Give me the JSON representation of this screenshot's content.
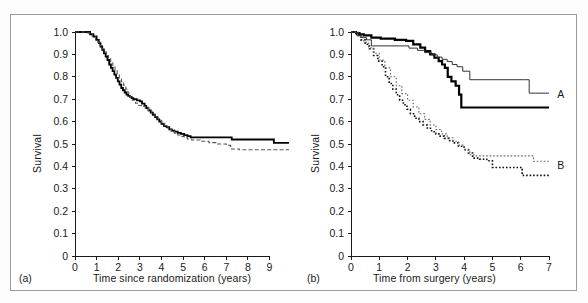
{
  "figure": {
    "background": "#ffffff",
    "frame_color": "#9a9a9a",
    "axis_color": "#1a1a1a"
  },
  "panels": [
    {
      "letter": "(a)",
      "ylabel": "Survival",
      "xlabel": "Time since randomization (years)",
      "curve_labels": []
    },
    {
      "letter": "(b)",
      "ylabel": "Survival",
      "xlabel": "Time from surgery (years)",
      "curve_labels": [
        {
          "text": "A",
          "x": 7.15,
          "y": 0.72
        },
        {
          "text": "B",
          "x": 7.15,
          "y": 0.4
        }
      ]
    }
  ],
  "chart_data": [
    {
      "id": "panel-a",
      "type": "line",
      "title": "",
      "xlabel": "Time since randomization (years)",
      "ylabel": "Survival",
      "xlim": [
        0,
        9.9
      ],
      "ylim": [
        0,
        1.0
      ],
      "xticks": [
        0,
        1,
        2,
        3,
        4,
        5,
        6,
        7,
        8,
        9
      ],
      "xticklabels": [
        "0",
        "1",
        "2",
        "3",
        "4",
        "5",
        "6",
        "7",
        "8",
        "9"
      ],
      "yticks": [
        0,
        0.1,
        0.2,
        0.3,
        0.4,
        0.5,
        0.6,
        0.7,
        0.8,
        0.9,
        1.0
      ],
      "yticklabels": [
        "0",
        "0.1",
        "0.2",
        "0.3",
        "0.4",
        "0.5",
        "0.6",
        "0.7",
        "0.8",
        "0.9",
        "1.0"
      ],
      "grid": false,
      "legend": "none",
      "series": [
        {
          "name": "observed",
          "style": "solid",
          "linewidth": 1.8,
          "color": "#000000",
          "step": "post",
          "x": [
            0,
            0.55,
            0.7,
            0.85,
            1.0,
            1.1,
            1.18,
            1.26,
            1.34,
            1.42,
            1.5,
            1.58,
            1.66,
            1.74,
            1.82,
            1.9,
            1.98,
            2.06,
            2.14,
            2.22,
            2.3,
            2.38,
            2.46,
            2.54,
            2.62,
            2.7,
            2.86,
            3.0,
            3.1,
            3.22,
            3.3,
            3.4,
            3.5,
            3.6,
            3.7,
            3.8,
            3.9,
            4.0,
            4.12,
            4.24,
            4.36,
            4.48,
            4.6,
            4.75,
            4.9,
            5.05,
            5.2,
            5.35,
            7.1,
            7.25,
            9.05,
            9.2,
            9.9
          ],
          "y": [
            1.0,
            1.0,
            0.99,
            0.98,
            0.965,
            0.95,
            0.935,
            0.92,
            0.905,
            0.89,
            0.875,
            0.855,
            0.84,
            0.825,
            0.81,
            0.795,
            0.78,
            0.765,
            0.75,
            0.74,
            0.73,
            0.72,
            0.715,
            0.71,
            0.705,
            0.7,
            0.695,
            0.69,
            0.68,
            0.67,
            0.66,
            0.65,
            0.64,
            0.63,
            0.62,
            0.61,
            0.6,
            0.59,
            0.58,
            0.575,
            0.565,
            0.56,
            0.555,
            0.55,
            0.545,
            0.54,
            0.535,
            0.53,
            0.53,
            0.52,
            0.52,
            0.505,
            0.505
          ]
        },
        {
          "name": "fitted",
          "style": "dashed",
          "linewidth": 1.1,
          "color": "#555555",
          "step": "post",
          "x": [
            0,
            0.6,
            0.8,
            0.95,
            1.05,
            1.15,
            1.25,
            1.35,
            1.45,
            1.55,
            1.65,
            1.75,
            1.85,
            1.95,
            2.05,
            2.15,
            2.25,
            2.35,
            2.45,
            2.55,
            2.65,
            2.8,
            2.95,
            3.1,
            3.25,
            3.4,
            3.55,
            3.7,
            3.85,
            4.0,
            4.15,
            4.3,
            4.45,
            4.6,
            4.75,
            4.9,
            5.05,
            5.2,
            5.4,
            5.8,
            6.2,
            6.6,
            7.0,
            7.2,
            7.6,
            8.4,
            9.2,
            9.9
          ],
          "y": [
            1.0,
            0.995,
            0.98,
            0.965,
            0.955,
            0.94,
            0.925,
            0.91,
            0.895,
            0.88,
            0.862,
            0.845,
            0.828,
            0.812,
            0.795,
            0.778,
            0.762,
            0.745,
            0.728,
            0.71,
            0.695,
            0.682,
            0.672,
            0.668,
            0.66,
            0.648,
            0.635,
            0.62,
            0.606,
            0.592,
            0.578,
            0.566,
            0.556,
            0.548,
            0.54,
            0.534,
            0.528,
            0.522,
            0.518,
            0.512,
            0.506,
            0.5,
            0.494,
            0.478,
            0.474,
            0.474,
            0.474,
            0.474
          ]
        }
      ]
    },
    {
      "id": "panel-b",
      "type": "line",
      "title": "",
      "xlabel": "Time from surgery (years)",
      "ylabel": "Survival",
      "xlim": [
        0,
        7
      ],
      "ylim": [
        0,
        1.0
      ],
      "xticks": [
        0,
        1,
        2,
        3,
        4,
        5,
        6,
        7
      ],
      "xticklabels": [
        "0",
        "1",
        "2",
        "3",
        "4",
        "5",
        "6",
        "7"
      ],
      "yticks": [
        0,
        0.1,
        0.2,
        0.3,
        0.4,
        0.5,
        0.6,
        0.7,
        0.8,
        0.9,
        1.0
      ],
      "yticklabels": [
        "0",
        "0.1",
        "0.2",
        "0.3",
        "0.4",
        "0.5",
        "0.6",
        "0.7",
        "0.8",
        "0.9",
        "1.0"
      ],
      "grid": false,
      "legend": "inline-labels",
      "series": [
        {
          "name": "A-observed",
          "group": "A",
          "style": "solid",
          "linewidth": 2.2,
          "color": "#000000",
          "step": "post",
          "x": [
            0,
            0.18,
            0.3,
            0.45,
            0.72,
            1.05,
            1.55,
            1.95,
            2.2,
            2.45,
            2.62,
            2.8,
            2.95,
            3.1,
            3.22,
            3.32,
            3.42,
            3.55,
            3.7,
            3.82,
            3.9,
            7.0
          ],
          "y": [
            1.0,
            0.995,
            0.99,
            0.985,
            0.975,
            0.97,
            0.965,
            0.96,
            0.945,
            0.93,
            0.915,
            0.9,
            0.885,
            0.87,
            0.855,
            0.84,
            0.8,
            0.78,
            0.76,
            0.72,
            0.663,
            0.663
          ]
        },
        {
          "name": "A-fitted",
          "group": "A",
          "style": "solid",
          "linewidth": 1.0,
          "color": "#333333",
          "step": "post",
          "x": [
            0,
            0.2,
            0.38,
            0.55,
            0.72,
            1.8,
            2.05,
            2.35,
            2.6,
            2.85,
            3.05,
            3.22,
            3.4,
            3.58,
            3.75,
            3.95,
            4.2,
            6.1,
            6.3,
            7.0
          ],
          "y": [
            1.0,
            0.985,
            0.975,
            0.965,
            0.938,
            0.938,
            0.928,
            0.918,
            0.908,
            0.898,
            0.888,
            0.878,
            0.868,
            0.855,
            0.845,
            0.825,
            0.787,
            0.787,
            0.727,
            0.727
          ]
        },
        {
          "name": "B-observed",
          "group": "B",
          "style": "dotted",
          "linewidth": 1.6,
          "color": "#111111",
          "step": "post",
          "x": [
            0,
            0.2,
            0.35,
            0.5,
            0.65,
            0.8,
            0.95,
            1.1,
            1.22,
            1.35,
            1.48,
            1.6,
            1.72,
            1.85,
            1.98,
            2.1,
            2.25,
            2.4,
            2.55,
            2.7,
            2.85,
            3.0,
            3.15,
            3.3,
            3.45,
            3.6,
            3.8,
            4.0,
            4.15,
            4.3,
            4.55,
            4.8,
            5.0,
            5.6,
            6.05,
            6.2,
            7.0
          ],
          "y": [
            1.0,
            0.985,
            0.965,
            0.945,
            0.925,
            0.895,
            0.87,
            0.845,
            0.8,
            0.77,
            0.745,
            0.72,
            0.695,
            0.675,
            0.655,
            0.635,
            0.615,
            0.6,
            0.585,
            0.57,
            0.555,
            0.545,
            0.535,
            0.525,
            0.515,
            0.505,
            0.49,
            0.475,
            0.46,
            0.437,
            0.432,
            0.425,
            0.395,
            0.395,
            0.36,
            0.36,
            0.36
          ]
        },
        {
          "name": "B-fitted",
          "group": "B",
          "style": "dotted",
          "linewidth": 1.1,
          "color": "#666666",
          "step": "post",
          "x": [
            0,
            0.25,
            0.45,
            0.62,
            0.8,
            1.0,
            1.2,
            1.4,
            1.6,
            1.8,
            2.0,
            2.2,
            2.4,
            2.6,
            2.8,
            3.0,
            3.2,
            3.4,
            3.6,
            3.8,
            4.0,
            4.2,
            4.35,
            6.3,
            6.45,
            7.0
          ],
          "y": [
            1.0,
            0.98,
            0.955,
            0.93,
            0.905,
            0.875,
            0.84,
            0.8,
            0.76,
            0.725,
            0.695,
            0.665,
            0.635,
            0.61,
            0.585,
            0.565,
            0.545,
            0.528,
            0.512,
            0.495,
            0.475,
            0.452,
            0.447,
            0.447,
            0.423,
            0.423
          ]
        }
      ]
    }
  ]
}
